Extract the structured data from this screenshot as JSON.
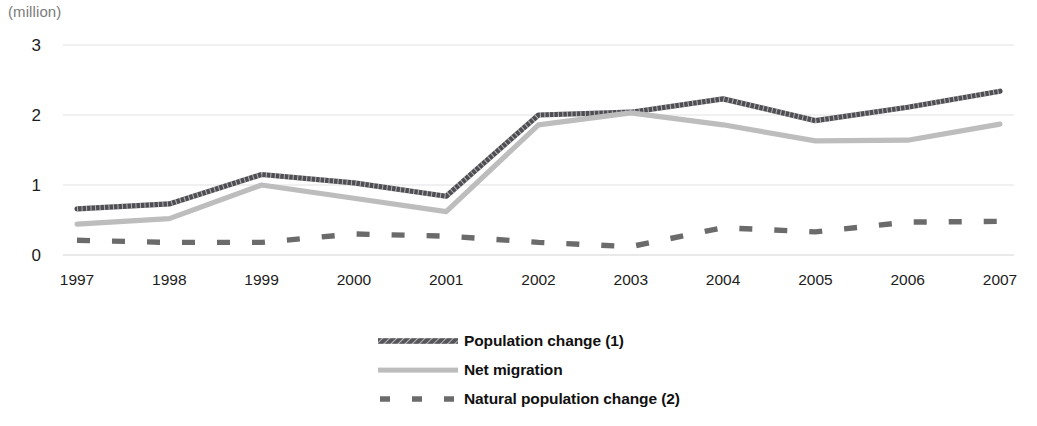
{
  "unit_note": "(million)",
  "chart_data": {
    "type": "line",
    "title": "",
    "xlabel": "",
    "ylabel": "(million)",
    "grid": true,
    "legend_position": "bottom-center",
    "ylim": [
      0,
      3
    ],
    "yticks": [
      0,
      1,
      2,
      3
    ],
    "ytick_labels": [
      "0",
      "1",
      "2",
      "3"
    ],
    "categories": [
      "1997",
      "1998",
      "1999",
      "2000",
      "2001",
      "2002",
      "2003",
      "2004",
      "2005",
      "2006",
      "2007"
    ],
    "series": [
      {
        "name": "Population change (1)",
        "style": "hatched-solid",
        "color": "#55555a",
        "values": [
          0.66,
          0.73,
          1.15,
          1.03,
          0.84,
          2.0,
          2.04,
          2.23,
          1.92,
          2.11,
          2.34
        ]
      },
      {
        "name": "Net migration",
        "style": "solid",
        "color": "#bdbdbd",
        "values": [
          0.44,
          0.52,
          1.0,
          0.81,
          0.62,
          1.86,
          2.03,
          1.86,
          1.63,
          1.64,
          1.87
        ]
      },
      {
        "name": "Natural population change (2)",
        "style": "dashed",
        "color": "#6b6b6b",
        "values": [
          0.21,
          0.18,
          0.18,
          0.3,
          0.27,
          0.18,
          0.12,
          0.39,
          0.33,
          0.47,
          0.48
        ]
      }
    ]
  },
  "axis": {
    "y_ticks": [
      "0",
      "1",
      "2",
      "3"
    ],
    "x_ticks": [
      "1997",
      "1998",
      "1999",
      "2000",
      "2001",
      "2002",
      "2003",
      "2004",
      "2005",
      "2006",
      "2007"
    ]
  },
  "legend": [
    {
      "label": "Population change (1)",
      "swatch": "hatched-line-swatch",
      "color": "#55555a"
    },
    {
      "label": "Net migration",
      "swatch": "solid-line-swatch",
      "color": "#bdbdbd"
    },
    {
      "label": "Natural population change (2)",
      "swatch": "dashed-line-swatch",
      "color": "#6b6b6b"
    }
  ],
  "colors": {
    "population_change": "#55555a",
    "net_migration": "#bdbdbd",
    "natural_change": "#6b6b6b",
    "grid": "#e2e2e2",
    "text": "#1c1c1c",
    "note": "#7b7b7b",
    "background": "#ffffff"
  }
}
